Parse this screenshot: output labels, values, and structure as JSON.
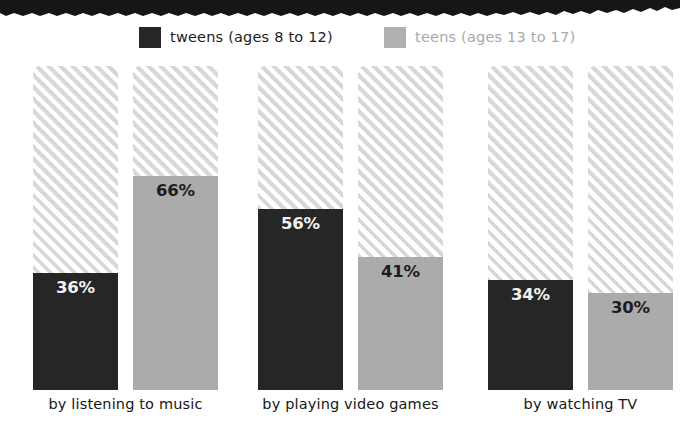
{
  "decor": {
    "torn_band": "torn-paper-band",
    "torn_band_color": "#161616"
  },
  "legend": {
    "position": "top-center",
    "items": [
      {
        "label": "tweens (ages 8 to 12)",
        "color": "#262626",
        "swatch": "legend-swatch-dark"
      },
      {
        "label": "teens (ages 13 to 17)",
        "color": "#b0b0b0",
        "swatch": "legend-swatch-light"
      }
    ]
  },
  "chart_data": {
    "type": "bar",
    "title": "",
    "subtitle": "",
    "xlabel": "",
    "ylabel": "",
    "ylim": [
      0,
      100
    ],
    "grid": false,
    "legend_position": "top",
    "value_suffix": "%",
    "categories": [
      "by listening to music",
      "by playing video games",
      "by watching TV"
    ],
    "series": [
      {
        "name": "tweens (ages 8 to 12)",
        "color": "#262626",
        "label_color": "#f2f2f2",
        "values": [
          36,
          41,
          34
        ],
        "value_labels": [
          "36%",
          "56%",
          "34%"
        ]
      },
      {
        "name": "teens (ages 13 to 17)",
        "color": "#ababab",
        "label_color": "#1d1d1d",
        "values": [
          66,
          41,
          30
        ],
        "value_labels": [
          "66%",
          "41%",
          "30%"
        ]
      }
    ],
    "groups": [
      {
        "category": "by listening to music",
        "bars": [
          {
            "series": "tweens (ages 8 to 12)",
            "value": 36,
            "value_label": "36%"
          },
          {
            "series": "teens (ages 13 to 17)",
            "value": 66,
            "value_label": "66%"
          }
        ]
      },
      {
        "category": "by playing video games",
        "bars": [
          {
            "series": "tweens (ages 8 to 12)",
            "value": 56,
            "value_label": "56%"
          },
          {
            "series": "teens (ages 13 to 17)",
            "value": 41,
            "value_label": "41%"
          }
        ]
      },
      {
        "category": "by watching TV",
        "bars": [
          {
            "series": "tweens (ages 8 to 12)",
            "value": 34,
            "value_label": "34%"
          },
          {
            "series": "teens (ages 13 to 17)",
            "value": 30,
            "value_label": "30%"
          }
        ]
      }
    ],
    "remainder_style": {
      "pattern": "diagonal-hatch",
      "stripe_color": "#d8d8d8",
      "background_color": "#ffffff"
    }
  }
}
